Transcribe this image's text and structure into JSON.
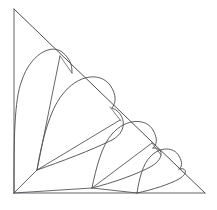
{
  "figure": {
    "title": "Recursive spiral of heart-shaped arcs in a right triangle",
    "background_color": "#ffffff",
    "stroke_color": "#4a4b4f",
    "canvas": {
      "width": 217,
      "height": 210
    },
    "triangle": {
      "name": "outer-right-triangle",
      "apex": {
        "x": 14,
        "y": 9
      },
      "bottom_left": {
        "x": 14,
        "y": 193
      },
      "bottom_right": {
        "x": 205,
        "y": 193
      },
      "right_angle_at": "bottom-left",
      "vertical_leg_length": 184,
      "horizontal_leg_length": 191
    },
    "levels": [
      {
        "index": 1,
        "label": "level-1",
        "scale": 1.0,
        "pivot": {
          "x": 14,
          "y": 193
        },
        "cusp": {
          "x": 14,
          "y": 193
        },
        "lobe_top": {
          "x": 44,
          "y": 48
        },
        "touch_point": {
          "x": 72,
          "y": 72
        },
        "arc_start": {
          "x": 14,
          "y": 76
        },
        "arc_end": {
          "x": 75,
          "y": 76
        }
      },
      {
        "index": 2,
        "label": "level-2",
        "scale": 0.72,
        "pivot": {
          "x": 37,
          "y": 170
        },
        "cusp": {
          "x": 37,
          "y": 170
        },
        "lobe_top": {
          "x": 78,
          "y": 78
        },
        "touch_point": {
          "x": 120,
          "y": 120
        },
        "arc_start": {
          "x": 40,
          "y": 125
        },
        "arc_end": {
          "x": 122,
          "y": 124
        }
      },
      {
        "index": 3,
        "label": "level-3",
        "scale": 0.52,
        "pivot": {
          "x": 92,
          "y": 188
        },
        "cusp": {
          "x": 92,
          "y": 188
        },
        "lobe_top": {
          "x": 124,
          "y": 117
        },
        "touch_point": {
          "x": 160,
          "y": 154
        },
        "arc_start": {
          "x": 98,
          "y": 160
        },
        "arc_end": {
          "x": 162,
          "y": 158
        }
      },
      {
        "index": 4,
        "label": "level-4",
        "scale": 0.3,
        "pivot": {
          "x": 137,
          "y": 193
        },
        "cusp": {
          "x": 137,
          "y": 193
        },
        "lobe_top": {
          "x": 160,
          "y": 148
        },
        "touch_point": {
          "x": 186,
          "y": 176
        },
        "arc_start": {
          "x": 146,
          "y": 180
        },
        "arc_end": {
          "x": 188,
          "y": 179
        }
      }
    ],
    "radius_segments": [
      {
        "name": "radius-level-1",
        "from": {
          "x": 60,
          "y": 56
        },
        "to": {
          "x": 72,
          "y": 73
        }
      },
      {
        "name": "radius-level-2",
        "from": {
          "x": 110,
          "y": 107
        },
        "to": {
          "x": 121,
          "y": 121
        }
      },
      {
        "name": "radius-level-3",
        "from": {
          "x": 152,
          "y": 143
        },
        "to": {
          "x": 161,
          "y": 155
        }
      }
    ],
    "spoke_segments": [
      {
        "name": "spoke-to-pivot-2",
        "from": {
          "x": 14,
          "y": 193
        },
        "to": {
          "x": 37,
          "y": 170
        }
      },
      {
        "name": "spoke-to-pivot-3",
        "from": {
          "x": 14,
          "y": 193
        },
        "to": {
          "x": 92,
          "y": 188
        }
      },
      {
        "name": "spoke-diagonal-2",
        "from": {
          "x": 37,
          "y": 170
        },
        "to": {
          "x": 120,
          "y": 120
        }
      },
      {
        "name": "spoke-vertical-2",
        "from": {
          "x": 37,
          "y": 170
        },
        "to": {
          "x": 60,
          "y": 56
        }
      }
    ],
    "vertices": [
      {
        "name": "vertex-apex",
        "x": 14,
        "y": 9
      },
      {
        "name": "vertex-bottom-left",
        "x": 14,
        "y": 193
      },
      {
        "name": "vertex-bottom-right",
        "x": 205,
        "y": 193
      },
      {
        "name": "vertex-pivot-2",
        "x": 37,
        "y": 170
      },
      {
        "name": "vertex-pivot-3",
        "x": 92,
        "y": 188
      }
    ],
    "counts": {
      "heart_lobes": 4,
      "triangle_edges": 3,
      "radius_segments": 3
    }
  }
}
